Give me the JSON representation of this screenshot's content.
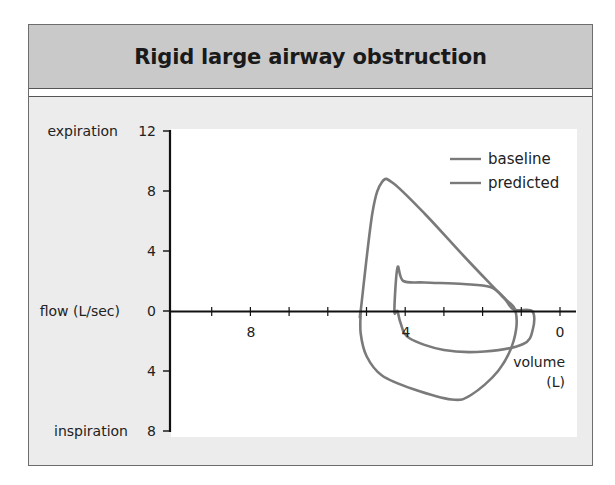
{
  "title": "Rigid large airway obstruction",
  "colors": {
    "curve": "#7a7a7a",
    "axis": "#111111",
    "panel_bg": "#ececec",
    "title_bg": "#c9c9c9",
    "plot_bg": "#ffffff"
  },
  "y_axis": {
    "label_top": "expiration",
    "label_mid": "flow (L/sec)",
    "label_bottom": "inspiration",
    "ticks": [
      "12",
      "8",
      "4",
      "0",
      "4",
      "8"
    ]
  },
  "x_axis": {
    "label_line1": "volume",
    "label_line2": "(L)",
    "tick_labels": [
      "8",
      "4",
      "0"
    ]
  },
  "legend": {
    "items": [
      {
        "label": "baseline"
      },
      {
        "label": "predicted"
      }
    ]
  },
  "chart_data": {
    "type": "line",
    "title": "Rigid large airway obstruction",
    "xlabel": "volume (L)",
    "ylabel": "flow (L/sec)",
    "x_reversed": true,
    "xlim": [
      10,
      0
    ],
    "ylim": [
      -8,
      12
    ],
    "x_ticks": [
      0,
      1,
      2,
      3,
      4,
      5,
      6,
      7,
      8,
      9
    ],
    "x_tick_labels": {
      "8": "8",
      "4": "4",
      "0": "0"
    },
    "y_ticks": [
      12,
      8,
      4,
      0,
      -4,
      -8
    ],
    "y_tick_labels": [
      "12",
      "8",
      "4",
      "0",
      "4",
      "8"
    ],
    "y_annotations": {
      "12": "expiration",
      "0": "flow (L/sec)",
      "-8": "inspiration"
    },
    "grid": false,
    "legend_position": "upper right",
    "series": [
      {
        "name": "baseline",
        "description": "flow-volume loop with flattened expiratory and inspiratory limbs (plateau)",
        "points": [
          [
            4.28,
            0
          ],
          [
            4.2,
            2.9
          ],
          [
            4.05,
            2.0
          ],
          [
            3.5,
            1.9
          ],
          [
            2.5,
            1.8
          ],
          [
            1.8,
            1.6
          ],
          [
            1.45,
            0.9
          ],
          [
            1.2,
            0.1
          ],
          [
            0.72,
            0
          ],
          [
            0.7,
            -1.2
          ],
          [
            0.95,
            -2.2
          ],
          [
            1.95,
            -2.7
          ],
          [
            3.0,
            -2.6
          ],
          [
            3.9,
            -1.8
          ],
          [
            4.12,
            -0.8
          ],
          [
            4.2,
            0
          ]
        ]
      },
      {
        "name": "predicted",
        "description": "normal triangular expiratory limb and rounded inspiratory limb",
        "points": [
          [
            5.15,
            0
          ],
          [
            4.85,
            6.5
          ],
          [
            4.6,
            8.6
          ],
          [
            4.3,
            8.5
          ],
          [
            3.5,
            6.5
          ],
          [
            2.5,
            3.7
          ],
          [
            1.5,
            1.0
          ],
          [
            1.15,
            0
          ],
          [
            1.2,
            -2.0
          ],
          [
            1.6,
            -4.0
          ],
          [
            2.3,
            -5.6
          ],
          [
            2.8,
            -5.9
          ],
          [
            3.8,
            -5.2
          ],
          [
            4.6,
            -4.3
          ],
          [
            5.0,
            -3.0
          ],
          [
            5.15,
            -1.5
          ],
          [
            5.15,
            0
          ]
        ]
      }
    ]
  }
}
